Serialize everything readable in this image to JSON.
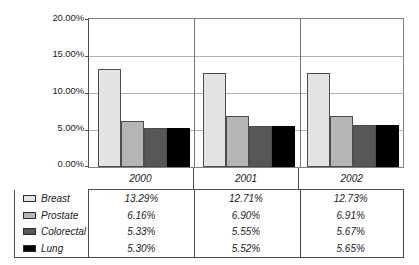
{
  "chart_data": {
    "type": "bar",
    "title": "",
    "xlabel": "",
    "ylabel": "",
    "categories": [
      "2000",
      "2001",
      "2002"
    ],
    "series": [
      {
        "name": "Breast",
        "color": "#e3e3e3",
        "values": [
          13.29,
          12.71,
          12.73
        ],
        "labels": [
          "13.29%",
          "12.71%",
          "12.73%"
        ]
      },
      {
        "name": "Prostate",
        "color": "#b5b5b5",
        "values": [
          6.16,
          6.9,
          6.91
        ],
        "labels": [
          "6.16%",
          "6.90%",
          "6.91%"
        ]
      },
      {
        "name": "Colorectal",
        "color": "#575757",
        "values": [
          5.33,
          5.55,
          5.67
        ],
        "labels": [
          "5.33%",
          "5.55%",
          "5.67%"
        ]
      },
      {
        "name": "Lung",
        "color": "#000000",
        "values": [
          5.3,
          5.52,
          5.65
        ],
        "labels": [
          "5.30%",
          "5.52%",
          "5.65%"
        ]
      }
    ],
    "ylim": [
      0,
      20
    ],
    "ytick_labels": [
      "20.00%",
      "15.00%",
      "10.00%",
      "5.00%",
      "0.00%"
    ],
    "ytick_values": [
      20,
      15,
      10,
      5,
      0
    ],
    "grid": true,
    "legend_position": "bottom-table",
    "units": "percent"
  },
  "axis": {
    "y": {
      "t20": "20.00%",
      "t15": "15.00%",
      "t10": "10.00%",
      "t5": "5.00%",
      "t0": "0.00%"
    }
  },
  "table": {
    "years": {
      "y2000": "2000",
      "y2001": "2001",
      "y2002": "2002"
    },
    "rows": {
      "breast": {
        "name": "Breast",
        "v2000": "13.29%",
        "v2001": "12.71%",
        "v2002": "12.73%"
      },
      "prostate": {
        "name": "Prostate",
        "v2000": "6.16%",
        "v2001": "6.90%",
        "v2002": "6.91%"
      },
      "colorectal": {
        "name": "Colorectal",
        "v2000": "5.33%",
        "v2001": "5.55%",
        "v2002": "5.67%"
      },
      "lung": {
        "name": "Lung",
        "v2000": "5.30%",
        "v2001": "5.52%",
        "v2002": "5.65%"
      }
    }
  }
}
